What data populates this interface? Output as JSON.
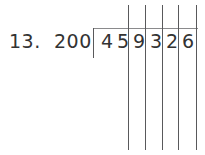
{
  "problem": {
    "number_label": "13.",
    "divisor": "200",
    "dividend_digits": [
      "4",
      "5",
      "9",
      "3",
      "2",
      "6"
    ],
    "dividend": "459326",
    "operation": "long-division"
  },
  "colors": {
    "text": "#333333",
    "rule_line": "#59595b",
    "bracket_line": "#8a8a8c",
    "background": "#ffffff"
  },
  "geometry": {
    "digit_left_positions": [
      101,
      117,
      133,
      150,
      166,
      182
    ],
    "vertical_line_x": [
      128,
      145,
      162,
      178,
      196
    ],
    "bracket_x": 93,
    "bracket_top_y": 28,
    "bracket_width": 105
  }
}
